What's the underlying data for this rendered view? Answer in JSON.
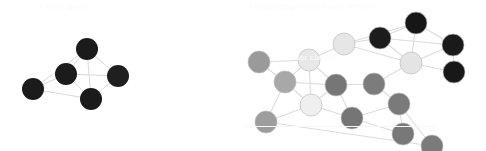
{
  "figure": {
    "background_color": "#ffffff",
    "edge_color": "#d9d9d9",
    "node_outline_color": "#bfbfbf",
    "width": 486,
    "height": 151
  },
  "faint_overlay": {
    "top_text_left": "a small graph",
    "top_text_right": "a larger graph with many vertices",
    "mid_text_right": "color classes",
    "rule_visible": true
  },
  "chart_data": {
    "type": "diagram",
    "subtype": "node-link-graph",
    "graphs": [
      {
        "id": "graph-left",
        "label": "small graph",
        "node_count": 5,
        "edge_count": 9,
        "radius": 11,
        "nodes": [
          {
            "id": 0,
            "x": 87,
            "y": 49,
            "color": "#1b1b1b",
            "label": "L0"
          },
          {
            "id": 1,
            "x": 66,
            "y": 74,
            "color": "#1b1b1b",
            "label": "L1"
          },
          {
            "id": 2,
            "x": 33,
            "y": 89,
            "color": "#1b1b1b",
            "label": "L2"
          },
          {
            "id": 3,
            "x": 91,
            "y": 99,
            "color": "#1b1b1b",
            "label": "L3"
          },
          {
            "id": 4,
            "x": 118,
            "y": 76,
            "color": "#1f1f1f",
            "label": "L4"
          }
        ],
        "edges": [
          [
            0,
            1
          ],
          [
            0,
            2
          ],
          [
            0,
            3
          ],
          [
            0,
            4
          ],
          [
            1,
            2
          ],
          [
            1,
            3
          ],
          [
            1,
            4
          ],
          [
            2,
            3
          ],
          [
            3,
            4
          ]
        ]
      },
      {
        "id": "graph-right",
        "label": "larger graph",
        "node_count": 17,
        "edge_count": 31,
        "radius": 11,
        "nodes": [
          {
            "id": 0,
            "x": 259,
            "y": 62,
            "color": "#9a9a9a",
            "label": "R0"
          },
          {
            "id": 1,
            "x": 285,
            "y": 82,
            "color": "#a8a8a8",
            "label": "R1"
          },
          {
            "id": 2,
            "x": 309,
            "y": 60,
            "color": "#e8e8e8",
            "label": "R2"
          },
          {
            "id": 3,
            "x": 344,
            "y": 44,
            "color": "#e6e6e6",
            "label": "R3"
          },
          {
            "id": 4,
            "x": 311,
            "y": 105,
            "color": "#efefef",
            "label": "R4"
          },
          {
            "id": 5,
            "x": 266,
            "y": 122,
            "color": "#9d9d9d",
            "label": "R5"
          },
          {
            "id": 6,
            "x": 336,
            "y": 85,
            "color": "#767676",
            "label": "R6"
          },
          {
            "id": 7,
            "x": 374,
            "y": 84,
            "color": "#7c7c7c",
            "label": "R7"
          },
          {
            "id": 8,
            "x": 352,
            "y": 118,
            "color": "#757575",
            "label": "R8"
          },
          {
            "id": 9,
            "x": 399,
            "y": 104,
            "color": "#7a7a7a",
            "label": "R9"
          },
          {
            "id": 10,
            "x": 403,
            "y": 134,
            "color": "#787878",
            "label": "R10"
          },
          {
            "id": 11,
            "x": 380,
            "y": 38,
            "color": "#1c1c1c",
            "label": "R11"
          },
          {
            "id": 12,
            "x": 416,
            "y": 23,
            "color": "#161616",
            "label": "R12"
          },
          {
            "id": 13,
            "x": 453,
            "y": 45,
            "color": "#1a1a1a",
            "label": "R13"
          },
          {
            "id": 14,
            "x": 454,
            "y": 72,
            "color": "#181818",
            "label": "R14"
          },
          {
            "id": 15,
            "x": 411,
            "y": 63,
            "color": "#e4e4e4",
            "label": "R15"
          },
          {
            "id": 16,
            "x": 432,
            "y": 146,
            "color": "#7b7b7b",
            "label": "R16"
          }
        ],
        "edges": [
          [
            0,
            1
          ],
          [
            0,
            2
          ],
          [
            1,
            2
          ],
          [
            1,
            5
          ],
          [
            1,
            6
          ],
          [
            1,
            4
          ],
          [
            2,
            3
          ],
          [
            2,
            4
          ],
          [
            2,
            6
          ],
          [
            3,
            11
          ],
          [
            3,
            15
          ],
          [
            3,
            12
          ],
          [
            4,
            5
          ],
          [
            4,
            6
          ],
          [
            4,
            8
          ],
          [
            5,
            16
          ],
          [
            6,
            7
          ],
          [
            6,
            8
          ],
          [
            7,
            9
          ],
          [
            7,
            15
          ],
          [
            8,
            9
          ],
          [
            8,
            10
          ],
          [
            9,
            10
          ],
          [
            9,
            16
          ],
          [
            11,
            12
          ],
          [
            11,
            15
          ],
          [
            11,
            13
          ],
          [
            12,
            13
          ],
          [
            12,
            15
          ],
          [
            13,
            14
          ],
          [
            13,
            15
          ],
          [
            14,
            15
          ]
        ]
      }
    ]
  }
}
